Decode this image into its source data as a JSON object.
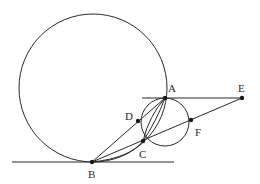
{
  "diagram": {
    "type": "geometry",
    "points": {
      "A": {
        "label": "A",
        "x": 165,
        "y": 98
      },
      "B": {
        "label": "B",
        "x": 92,
        "y": 162
      },
      "C": {
        "label": "C",
        "x": 143,
        "y": 141
      },
      "D": {
        "label": "D",
        "x": 138,
        "y": 121
      },
      "E": {
        "label": "E",
        "x": 242,
        "y": 98
      },
      "F": {
        "label": "F",
        "x": 191,
        "y": 120
      }
    },
    "circles": [
      {
        "name": "large-circle",
        "cx": 93,
        "cy": 88,
        "r": 74
      },
      {
        "name": "small-circle",
        "cx": 165,
        "cy": 122,
        "r": 24
      }
    ],
    "lines": [
      {
        "name": "tangent-line-AE",
        "from": "A",
        "to": "E"
      },
      {
        "name": "tangent-line-at-B",
        "note": "horizontal line through B"
      },
      {
        "name": "line-BDA",
        "from": "B",
        "to": "A"
      },
      {
        "name": "line-BCFE",
        "from": "B",
        "to": "E"
      },
      {
        "name": "arc-BCA",
        "from": "B",
        "to": "A"
      },
      {
        "name": "chord-CA",
        "from": "C",
        "to": "A"
      }
    ],
    "labels": [
      "A",
      "B",
      "C",
      "D",
      "E",
      "F"
    ]
  }
}
